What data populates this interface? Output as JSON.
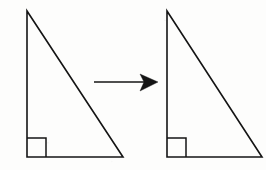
{
  "figure": {
    "description": "Two congruent right triangles separated by a rightward arrow",
    "background_color": "#fdfdfc",
    "stroke_color": "#141414",
    "canvas": {
      "width": 266,
      "height": 170
    }
  },
  "shapes": {
    "left_triangle": {
      "name": "left-right-triangle",
      "label": "",
      "points": "27,11 27,157 123,157",
      "vertices": {
        "apex": {
          "x": 27,
          "y": 11
        },
        "bottom_left": {
          "x": 27,
          "y": 157
        },
        "bottom_right": {
          "x": 123,
          "y": 157
        }
      },
      "right_angle_marker": {
        "name": "right-angle-square",
        "path": "M 27 138 L 46 138 L 46 157",
        "size": 19,
        "corner": "bottom-left"
      }
    },
    "right_triangle": {
      "name": "right-right-triangle",
      "label": "",
      "points": "167,11 167,157 262,157",
      "vertices": {
        "apex": {
          "x": 167,
          "y": 11
        },
        "bottom_left": {
          "x": 167,
          "y": 157
        },
        "bottom_right": {
          "x": 262,
          "y": 157
        }
      },
      "right_angle_marker": {
        "name": "right-angle-square",
        "path": "M 167 138 L 186 138 L 186 157",
        "size": 19,
        "corner": "bottom-left"
      }
    }
  },
  "arrow": {
    "name": "transformation-arrow",
    "direction": "right",
    "label": "",
    "shaft": {
      "x1": 94,
      "y1": 82,
      "x2": 145,
      "y2": 82
    },
    "head_points": "158,82 140,74 144,82 140,91",
    "color": "#141414"
  }
}
